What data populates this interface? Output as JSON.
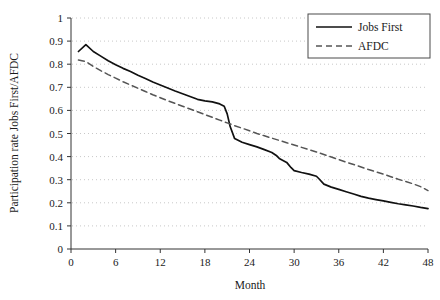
{
  "chart_data": {
    "type": "line",
    "title": "",
    "subtitle": "",
    "xlabel": "Month",
    "ylabel": "Participation rate Jobs First/AFDC",
    "xlim": [
      0,
      48
    ],
    "ylim": [
      0,
      1
    ],
    "xticks": [
      "0",
      "6",
      "12",
      "18",
      "24",
      "30",
      "36",
      "42",
      "48"
    ],
    "yticks": [
      "0",
      "0.1",
      "0.2",
      "0.3",
      "0.4",
      "0.5",
      "0.6",
      "0.7",
      "0.8",
      "0.9",
      "1"
    ],
    "grid": "horizontal-dotted",
    "legend_position": "top-right",
    "series": [
      {
        "name": "Jobs First",
        "style": "solid",
        "color": "#111111",
        "x": [
          1,
          2,
          3,
          4,
          5,
          6,
          7,
          8,
          9,
          10,
          11,
          12,
          13,
          14,
          15,
          16,
          17,
          18,
          19,
          20,
          20.6,
          21,
          21.4,
          22,
          23,
          24,
          25,
          26,
          27,
          27.6,
          28,
          29,
          29.6,
          30,
          31,
          32,
          33,
          33.4,
          34,
          35,
          36,
          37,
          38,
          39,
          40,
          41,
          42,
          43,
          44,
          45,
          46,
          47,
          48
        ],
        "y": [
          0.855,
          0.885,
          0.855,
          0.835,
          0.815,
          0.798,
          0.782,
          0.768,
          0.752,
          0.738,
          0.723,
          0.71,
          0.697,
          0.684,
          0.672,
          0.66,
          0.648,
          0.641,
          0.637,
          0.628,
          0.618,
          0.585,
          0.53,
          0.478,
          0.462,
          0.452,
          0.442,
          0.43,
          0.418,
          0.405,
          0.392,
          0.375,
          0.352,
          0.339,
          0.331,
          0.324,
          0.315,
          0.302,
          0.281,
          0.268,
          0.258,
          0.248,
          0.238,
          0.228,
          0.22,
          0.214,
          0.208,
          0.202,
          0.196,
          0.191,
          0.186,
          0.18,
          0.175
        ]
      },
      {
        "name": "AFDC",
        "style": "dashed",
        "color": "#555555",
        "x": [
          1,
          2,
          3,
          4,
          5,
          6,
          7,
          8,
          9,
          10,
          11,
          12,
          13,
          14,
          15,
          16,
          17,
          18,
          19,
          20,
          21,
          22,
          23,
          24,
          25,
          26,
          27,
          28,
          29,
          30,
          31,
          32,
          33,
          34,
          35,
          36,
          37,
          38,
          39,
          40,
          41,
          42,
          43,
          44,
          45,
          46,
          47,
          48
        ],
        "y": [
          0.818,
          0.812,
          0.79,
          0.772,
          0.755,
          0.74,
          0.724,
          0.71,
          0.696,
          0.682,
          0.668,
          0.655,
          0.642,
          0.63,
          0.618,
          0.606,
          0.594,
          0.582,
          0.57,
          0.558,
          0.546,
          0.534,
          0.523,
          0.512,
          0.5,
          0.49,
          0.48,
          0.47,
          0.46,
          0.45,
          0.44,
          0.43,
          0.42,
          0.409,
          0.398,
          0.387,
          0.376,
          0.366,
          0.355,
          0.344,
          0.334,
          0.324,
          0.313,
          0.302,
          0.292,
          0.282,
          0.27,
          0.253
        ]
      }
    ]
  },
  "legend": {
    "items": [
      {
        "label": "Jobs First",
        "style": "solid"
      },
      {
        "label": "AFDC",
        "style": "dashed"
      }
    ]
  },
  "axes": {
    "x_title": "Month",
    "y_title": "Participation rate Jobs First/AFDC"
  },
  "colors": {
    "jobs_first": "#111111",
    "afdc": "#555555",
    "grid": "#c8c8c8",
    "axis": "#333333",
    "background": "#ffffff"
  }
}
